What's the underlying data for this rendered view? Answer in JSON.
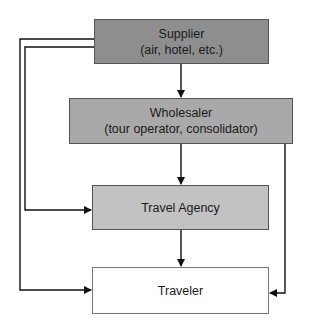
{
  "diagram": {
    "type": "flowchart",
    "title": "",
    "nodes": [
      {
        "id": "supplier",
        "label": "Supplier",
        "sublabel": "(air, hotel, etc.)",
        "fill": "#8e8e8e"
      },
      {
        "id": "wholesaler",
        "label": "Wholesaler",
        "sublabel": "(tour operator, consolidator)",
        "fill": "#a9a9a9"
      },
      {
        "id": "agency",
        "label": "Travel Agency",
        "sublabel": "",
        "fill": "#c2c2c2"
      },
      {
        "id": "traveler",
        "label": "Traveler",
        "sublabel": "",
        "fill": "#ffffff"
      }
    ],
    "edges": [
      {
        "from": "supplier",
        "to": "wholesaler"
      },
      {
        "from": "wholesaler",
        "to": "agency"
      },
      {
        "from": "agency",
        "to": "traveler"
      },
      {
        "from": "supplier",
        "to": "agency",
        "route": "left-inner"
      },
      {
        "from": "supplier",
        "to": "traveler",
        "route": "left-outer"
      },
      {
        "from": "wholesaler",
        "to": "traveler",
        "route": "right"
      }
    ]
  }
}
